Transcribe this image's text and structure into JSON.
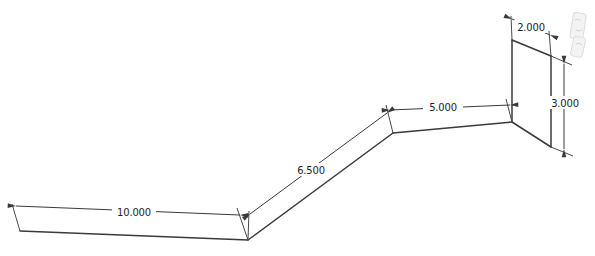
{
  "diagram": {
    "kind": "cad-dimensioned-sketch",
    "background_color": "#ffffff",
    "line_color": "#3a3a3a",
    "text_color": "#1e1e1e",
    "dimensions": [
      {
        "name": "base-length",
        "value": "10.000"
      },
      {
        "name": "incline-length",
        "value": "6.500"
      },
      {
        "name": "upper-length",
        "value": "5.000"
      },
      {
        "name": "plate-width",
        "value": "2.000"
      },
      {
        "name": "plate-height",
        "value": "3.000"
      }
    ]
  }
}
